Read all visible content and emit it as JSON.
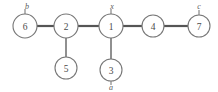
{
  "diagram": {
    "background_color": "#ffffff",
    "node_stroke_color": "#777777",
    "edge_color": "#555555",
    "label_color": "#4a4a4a",
    "nodes": [
      {
        "id": "n1",
        "label": "1",
        "x": 111,
        "y": 26,
        "r": 12
      },
      {
        "id": "n2",
        "label": "2",
        "x": 66,
        "y": 26,
        "r": 12
      },
      {
        "id": "n3",
        "label": "3",
        "x": 111,
        "y": 70,
        "r": 11
      },
      {
        "id": "n4",
        "label": "4",
        "x": 153,
        "y": 26,
        "r": 11
      },
      {
        "id": "n5",
        "label": "5",
        "x": 66,
        "y": 68,
        "r": 11
      },
      {
        "id": "n6",
        "label": "6",
        "x": 25,
        "y": 26,
        "r": 12
      },
      {
        "id": "n7",
        "label": "7",
        "x": 199,
        "y": 26,
        "r": 11
      }
    ],
    "edges": [
      {
        "from": "n6",
        "to": "n2",
        "weight": "thick"
      },
      {
        "from": "n2",
        "to": "n1",
        "weight": "thick"
      },
      {
        "from": "n1",
        "to": "n4",
        "weight": "thick"
      },
      {
        "from": "n4",
        "to": "n7",
        "weight": "thick"
      },
      {
        "from": "n2",
        "to": "n5",
        "weight": "thin"
      },
      {
        "from": "n1",
        "to": "n3",
        "weight": "thin"
      }
    ],
    "terminal_labels": [
      {
        "id": "t_b",
        "text": "b",
        "x": 27,
        "y": 6,
        "node": "n6",
        "position": "above"
      },
      {
        "id": "t_x",
        "text": "x",
        "x": 112,
        "y": 6,
        "node": "n1",
        "position": "above"
      },
      {
        "id": "t_c",
        "text": "c",
        "x": 199,
        "y": 6,
        "node": "n7",
        "position": "above"
      },
      {
        "id": "t_a",
        "text": "a",
        "x": 111,
        "y": 87,
        "node": "n3",
        "position": "below"
      }
    ],
    "stubs": [
      {
        "id": "s_b",
        "x1": 25,
        "y1": 14,
        "x2": 25,
        "y2": 9
      },
      {
        "id": "s_x",
        "x1": 111,
        "y1": 14,
        "x2": 111,
        "y2": 9
      },
      {
        "id": "s_c",
        "x1": 199,
        "y1": 15,
        "x2": 199,
        "y2": 10
      },
      {
        "id": "s_a",
        "x1": 111,
        "y1": 81,
        "x2": 111,
        "y2": 85
      }
    ]
  }
}
